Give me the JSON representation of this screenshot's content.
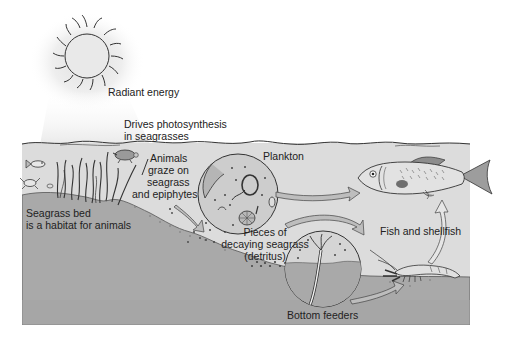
{
  "diagram": {
    "colors": {
      "water": "#dcdcdc",
      "seabed": "#a9a9a9",
      "seabed_dark": "#8f8f8f",
      "sun_fill": "#e4e4e4",
      "stroke": "#333333",
      "circle_fill": "#c8c8c8",
      "fish_fill": "#e2e2e2",
      "arrow_fill": "#bdbdbd"
    },
    "labels": {
      "radiant_energy": "Radiant energy",
      "photosynthesis_line1": "Drives photosynthesis",
      "photosynthesis_line2": "in seagrasses",
      "grazers_line1": "Animals",
      "grazers_line2": "graze on",
      "grazers_line3": "seagrass",
      "grazers_line4": "and epiphytes",
      "plankton": "Plankton",
      "habitat_line1": "Seagrass bed",
      "habitat_line2": "is a habitat for animals",
      "detritus_line1": "Pieces of",
      "detritus_line2": "decaying seagrass",
      "detritus_line3": "(detritus)",
      "fish_shellfish": "Fish and shellfish",
      "bottom_feeders": "Bottom feeders"
    },
    "nodes": [
      {
        "id": "sun",
        "label": "Radiant energy"
      },
      {
        "id": "seagrass",
        "label": "Seagrass bed"
      },
      {
        "id": "grazers",
        "label": "Animals graze on seagrass and epiphytes"
      },
      {
        "id": "plankton",
        "label": "Plankton"
      },
      {
        "id": "detritus",
        "label": "Pieces of decaying seagrass (detritus)"
      },
      {
        "id": "bottom_feeders",
        "label": "Bottom feeders"
      },
      {
        "id": "fish_shellfish",
        "label": "Fish and shellfish"
      }
    ],
    "edges": [
      {
        "from": "sun",
        "to": "seagrass",
        "label": "Drives photosynthesis in seagrasses"
      },
      {
        "from": "grazers",
        "to": "detritus"
      },
      {
        "from": "plankton",
        "to": "fish_shellfish"
      },
      {
        "from": "detritus",
        "to": "bottom_feeders"
      },
      {
        "from": "bottom_feeders",
        "to": "fish_shellfish"
      },
      {
        "from": "fish_shellfish",
        "to": "fish_shellfish",
        "note": "shrimp to fish"
      }
    ]
  }
}
